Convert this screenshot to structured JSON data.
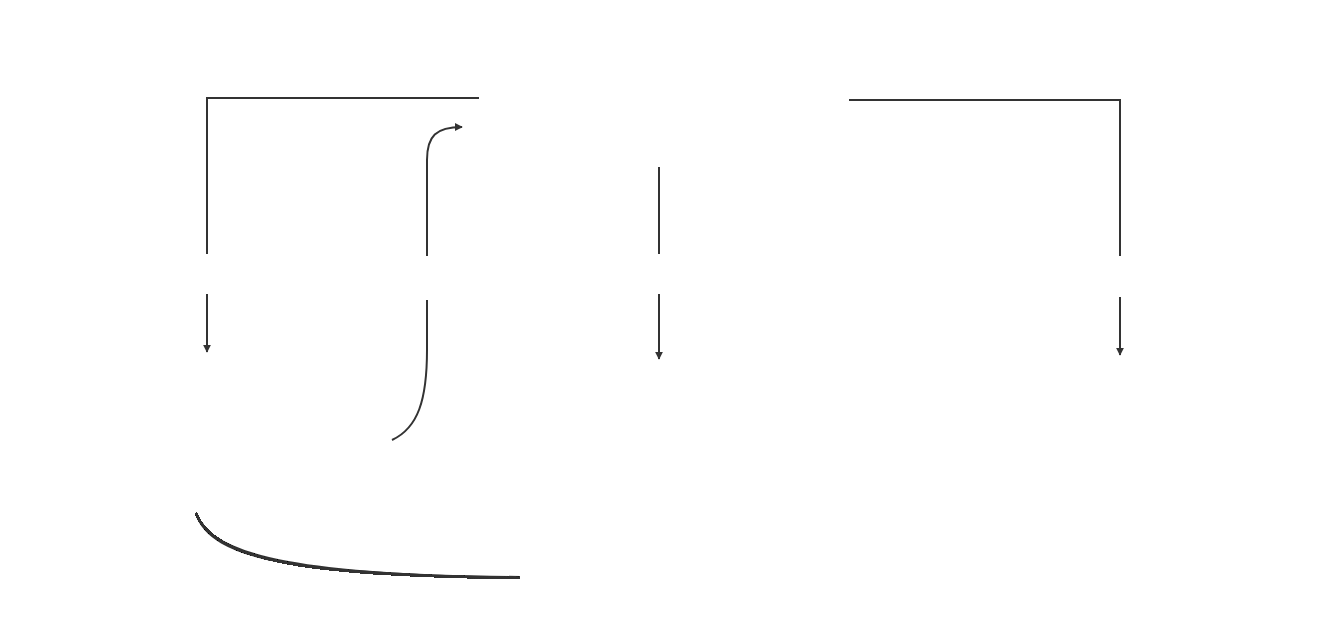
{
  "diagram": {
    "type": "flow",
    "colors": {
      "box_fill": "#b4b4b4",
      "box_border": "#3a3a3a",
      "line": "#333333",
      "text": "#2a2a2a",
      "background": "#ffffff"
    },
    "nodes": {
      "atmosphere": {
        "title": "Atmosphere",
        "subtitle": "(Oxygen)"
      },
      "biosphere": {
        "title": "Biosphere",
        "subtitle": "(Plants)"
      },
      "hydrosphere": {
        "title": "Hydrosphere",
        "subtitle": "(Dissolves in Oceans)"
      },
      "lithosphere": {
        "title": "Lithosphere",
        "subtitle": "(rocks)"
      }
    },
    "edges": {
      "respiration": {
        "label": "respiration",
        "from": "Atmosphere",
        "to": "Biosphere"
      },
      "photosynthesis": {
        "label": "photosynthesis",
        "from": "Biosphere",
        "to": "Atmosphere"
      },
      "dissolving": {
        "label": "dissolving",
        "from": "Atmosphere",
        "to": "Hydrosphere"
      },
      "weathering": {
        "label": "weathering",
        "from": "Atmosphere",
        "to": "Lithosphere"
      },
      "marine_life": {
        "label_line1": "marine life",
        "label_line2": "to calcium carbonate",
        "from": "Biosphere",
        "to": "Lithosphere"
      }
    }
  }
}
